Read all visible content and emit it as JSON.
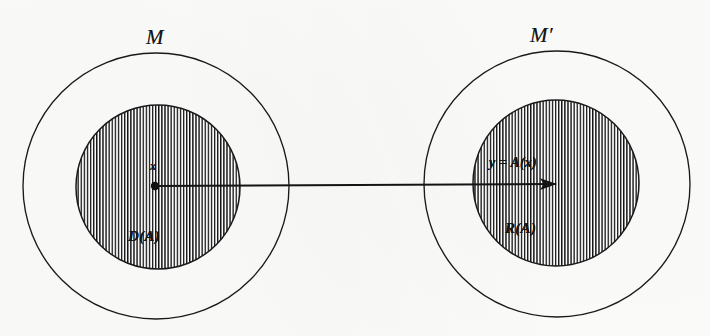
{
  "figure": {
    "kind": "set-mapping-diagram",
    "background_color": "#fdfdfc",
    "stroke_color": "#1a1a1a",
    "hatch_color": "#141414",
    "left": {
      "outer_set_label": "M",
      "inner_set_label": "D(A)",
      "point_label": "x",
      "outer": {
        "cx": 156,
        "cy": 186,
        "r": 133
      },
      "inner": {
        "cx": 158,
        "cy": 187,
        "r": 82
      },
      "point": {
        "cx": 155,
        "cy": 186,
        "r": 4.2
      },
      "outer_label_pos": {
        "x": 146,
        "y": 27
      },
      "inner_label_pos": {
        "x": 128,
        "y": 229
      },
      "point_label_pos": {
        "x": 150,
        "y": 160
      }
    },
    "right": {
      "outer_set_label": "M′",
      "inner_set_label": "R(A)",
      "map_label": "y = A(x)",
      "outer": {
        "cx": 557,
        "cy": 184,
        "r": 133
      },
      "inner": {
        "cx": 556,
        "cy": 183,
        "r": 83
      },
      "outer_label_pos": {
        "x": 530,
        "y": 25
      },
      "inner_label_pos": {
        "x": 505,
        "y": 221
      },
      "map_label_pos": {
        "x": 489,
        "y": 156
      }
    },
    "arrow": {
      "x1": 155,
      "y1": 186,
      "x2": 557,
      "y2": 184,
      "head_length": 13,
      "head_width": 8,
      "stroke_width": 2.1
    },
    "hatch": {
      "orientation": "vertical",
      "spacing_px": 3.1,
      "line_width_px": 1.35
    }
  }
}
